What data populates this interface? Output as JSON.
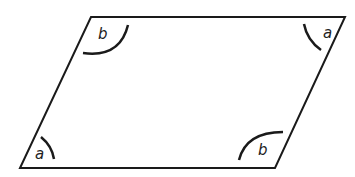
{
  "diagram": {
    "shape": "parallelogram",
    "stroke_color": "#1a1a1a",
    "vertices": {
      "top_left": [
        91,
        17
      ],
      "top_right": [
        345,
        17
      ],
      "bottom_right": [
        275,
        168
      ],
      "bottom_left": [
        20,
        168
      ]
    },
    "angles": [
      {
        "position": "top-left",
        "label": "b"
      },
      {
        "position": "top-right",
        "label": "a"
      },
      {
        "position": "bottom-left",
        "label": "a"
      },
      {
        "position": "bottom-right",
        "label": "b"
      }
    ]
  }
}
